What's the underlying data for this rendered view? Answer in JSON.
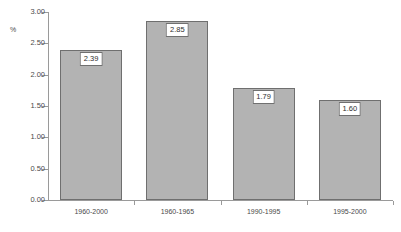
{
  "chart_data": {
    "type": "bar",
    "title": "",
    "xlabel": "",
    "ylabel": "%",
    "ylim": [
      0,
      3.0
    ],
    "ytick_step": 0.5,
    "grid": false,
    "legend": "none",
    "bar_color": "#b3b3b3",
    "bar_border_color": "#6f6f6f",
    "axis_color": "#9a9a9a",
    "categories": [
      "1960-2000",
      "1960-1965",
      "1990-1995",
      "1995-2000"
    ],
    "values": [
      2.39,
      2.85,
      1.79,
      1.6
    ],
    "value_labels": [
      "2.39",
      "2.85",
      "1.79",
      "1.60"
    ],
    "ytick_labels": [
      "3.00",
      "2.50",
      "2.00",
      "1.50",
      "1.00",
      "0.50",
      "0.00"
    ],
    "ytick_values": [
      3.0,
      2.5,
      2.0,
      1.5,
      1.0,
      0.5,
      0.0
    ]
  }
}
